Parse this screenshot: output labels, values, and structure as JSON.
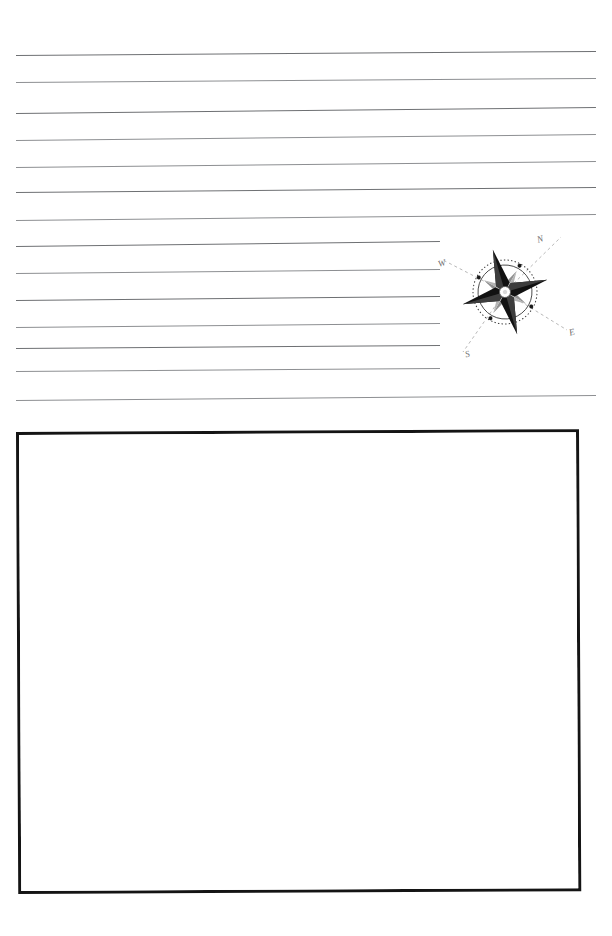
{
  "page": {
    "kind": "worksheet-page",
    "background_color": "#ffffff",
    "width": 612,
    "height": 936
  },
  "ruled_area": {
    "name": "ruled-writing-lines",
    "line_color": "#8d8f92",
    "line_count": 14,
    "left_margin_x": 16,
    "right_margin_x": 596,
    "lines": [
      {
        "y_left": 55,
        "y_right": 51,
        "x_end": 596,
        "weight": "dark"
      },
      {
        "y_left": 82,
        "y_right": 78,
        "x_end": 596,
        "weight": "light"
      },
      {
        "y_left": 113,
        "y_right": 107,
        "x_end": 596,
        "weight": "dark"
      },
      {
        "y_left": 140,
        "y_right": 134,
        "x_end": 596,
        "weight": "light"
      },
      {
        "y_left": 167,
        "y_right": 161,
        "x_end": 596,
        "weight": "light"
      },
      {
        "y_left": 192,
        "y_right": 187,
        "x_end": 596,
        "weight": "dark"
      },
      {
        "y_left": 220,
        "y_right": 214,
        "x_end": 596,
        "weight": "light"
      },
      {
        "y_left": 246,
        "y_right": 241,
        "x_end": 440,
        "weight": "dark"
      },
      {
        "y_left": 273,
        "y_right": 269,
        "x_end": 440,
        "weight": "light"
      },
      {
        "y_left": 300,
        "y_right": 296,
        "x_end": 440,
        "weight": "dark"
      },
      {
        "y_left": 327,
        "y_right": 323,
        "x_end": 440,
        "weight": "light"
      },
      {
        "y_left": 348,
        "y_right": 345,
        "x_end": 440,
        "weight": "dark"
      },
      {
        "y_left": 371,
        "y_right": 368,
        "x_end": 440,
        "weight": "light"
      },
      {
        "y_left": 400,
        "y_right": 395,
        "x_end": 596,
        "weight": "light"
      }
    ]
  },
  "compass": {
    "name": "compass-rose",
    "center_x": 505,
    "center_y": 292,
    "rotation_degrees": -16,
    "outer_ring_radius": 32,
    "inner_ring_radius": 27,
    "major_point_color": "#1a1a1a",
    "minor_point_color": "#8a8a8a",
    "labels": {
      "north": "N",
      "west": "W",
      "east": "E",
      "south": "S"
    },
    "tick_dot_count": 8,
    "leader_line_style": "dashed"
  },
  "drawing_box": {
    "name": "drawing-box",
    "border_color": "#141414",
    "border_width": 3,
    "fill_color": "#ffffff",
    "x": 16,
    "y": 432,
    "width": 563,
    "height": 462,
    "content": ""
  }
}
